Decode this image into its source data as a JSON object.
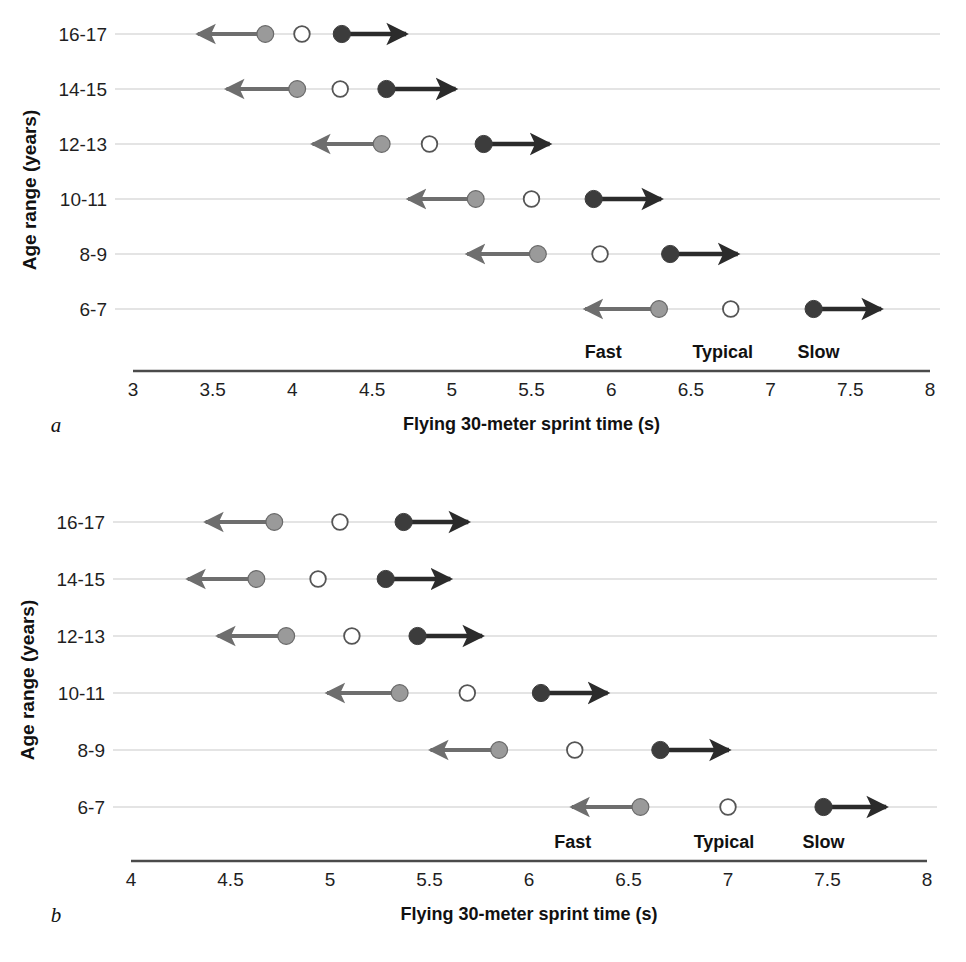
{
  "figure": {
    "y_axis_title": "Age range (years)",
    "x_axis_title": "Flying 30-meter sprint time (s)",
    "zone_labels": [
      "Fast",
      "Typical",
      "Slow"
    ],
    "colors": {
      "fast_marker": "#9a9a9a",
      "typical_marker": "#ffffff",
      "typical_marker_edge": "#555555",
      "slow_marker": "#3c3c3c",
      "fast_arrow": "#6e6e6e",
      "slow_arrow": "#2b2b2b",
      "row_line": "#c9c9c9",
      "axis_line": "#4b4b4b",
      "text": "#1f1f1f",
      "background": "#ffffff"
    }
  },
  "chart_data": [
    {
      "panel": "a",
      "panel_letter": "a",
      "type": "scatter",
      "title": "",
      "xlabel": "Flying 30-meter sprint time (s)",
      "ylabel": "Age range (years)",
      "xlim": [
        3,
        8
      ],
      "xticks": [
        3,
        3.5,
        4,
        4.5,
        5,
        5.5,
        6,
        6.5,
        7,
        7.5,
        8
      ],
      "xtick_labels": [
        "3",
        "3.5",
        "4",
        "4.5",
        "5",
        "5.5",
        "6",
        "6.5",
        "7",
        "7.5",
        "8"
      ],
      "categories": [
        "16-17",
        "14-15",
        "12-13",
        "10-11",
        "8-9",
        "6-7"
      ],
      "grid": false,
      "legend_position": "inline-bottom",
      "series": [
        {
          "name": "Fast",
          "values": [
            3.83,
            4.03,
            4.56,
            5.15,
            5.54,
            6.3
          ]
        },
        {
          "name": "Typical",
          "values": [
            4.06,
            4.3,
            4.86,
            5.5,
            5.93,
            6.75
          ]
        },
        {
          "name": "Slow",
          "values": [
            4.31,
            4.59,
            5.2,
            5.89,
            6.37,
            7.27
          ]
        }
      ],
      "fast_arrow_tip": [
        3.35,
        3.53,
        4.07,
        4.67,
        5.04,
        5.78
      ],
      "slow_arrow_tip": [
        4.77,
        5.08,
        5.67,
        6.37,
        6.85,
        7.75
      ],
      "zone_label_x": [
        5.95,
        6.7,
        7.3
      ]
    },
    {
      "panel": "b",
      "panel_letter": "b",
      "type": "scatter",
      "title": "",
      "xlabel": "Flying 30-meter sprint time (s)",
      "ylabel": "Age range (years)",
      "xlim": [
        4,
        8
      ],
      "xticks": [
        4,
        4.5,
        5,
        5.5,
        6,
        6.5,
        7,
        7.5,
        8
      ],
      "xtick_labels": [
        "4",
        "4.5",
        "5",
        "5.5",
        "6",
        "6.5",
        "7",
        "7.5",
        "8"
      ],
      "categories": [
        "16-17",
        "14-15",
        "12-13",
        "10-11",
        "8-9",
        "6-7"
      ],
      "grid": false,
      "legend_position": "inline-bottom",
      "series": [
        {
          "name": "Fast",
          "values": [
            4.72,
            4.63,
            4.78,
            5.35,
            5.85,
            6.56
          ]
        },
        {
          "name": "Typical",
          "values": [
            5.05,
            4.94,
            5.11,
            5.69,
            6.23,
            7.0
          ]
        },
        {
          "name": "Slow",
          "values": [
            5.37,
            5.28,
            5.44,
            6.06,
            6.66,
            7.48
          ]
        }
      ],
      "fast_arrow_tip": [
        4.33,
        4.24,
        4.39,
        4.94,
        5.46,
        6.17
      ],
      "slow_arrow_tip": [
        5.74,
        5.65,
        5.81,
        6.44,
        7.05,
        7.84
      ],
      "zone_label_x": [
        6.22,
        6.98,
        7.48
      ]
    }
  ]
}
